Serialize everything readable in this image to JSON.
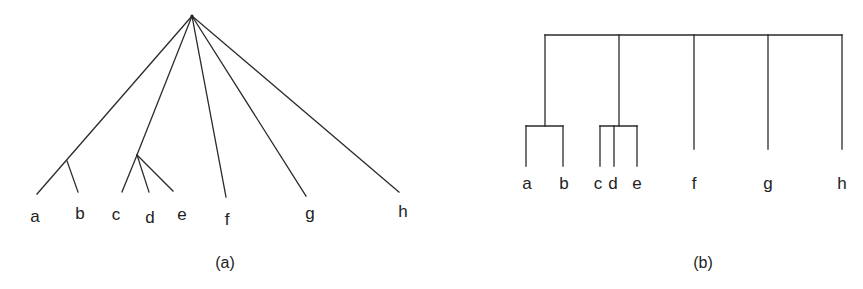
{
  "figure": {
    "panel_a": {
      "caption": "(a)",
      "type": "tree-diagram",
      "apex": [
        192,
        16
      ],
      "internal_nodes": {
        "ab": [
          67,
          161
        ],
        "cde": [
          137,
          155
        ]
      },
      "leaves": [
        {
          "label": "a",
          "end": [
            37,
            194
          ],
          "label_pos": [
            35,
            222
          ]
        },
        {
          "label": "b",
          "end": [
            78,
            192
          ],
          "label_pos": [
            80,
            219
          ]
        },
        {
          "label": "c",
          "end": [
            122,
            192
          ],
          "label_pos": [
            116,
            220
          ]
        },
        {
          "label": "d",
          "end": [
            149,
            192
          ],
          "label_pos": [
            150,
            223
          ]
        },
        {
          "label": "e",
          "end": [
            173,
            191
          ],
          "label_pos": [
            182,
            220
          ]
        },
        {
          "label": "f",
          "end": [
            226,
            197
          ],
          "label_pos": [
            227,
            225
          ]
        },
        {
          "label": "g",
          "end": [
            306,
            196
          ],
          "label_pos": [
            310,
            219
          ]
        },
        {
          "label": "h",
          "end": [
            399,
            192
          ],
          "label_pos": [
            403,
            217
          ]
        }
      ],
      "caption_pos": [
        225,
        268
      ]
    },
    "panel_b": {
      "caption": "(b)",
      "type": "dendrogram",
      "top_bar": {
        "y": 35,
        "x1": 545,
        "x2": 842
      },
      "labels": [
        "a",
        "b",
        "c",
        "d",
        "e",
        "f",
        "g",
        "h"
      ],
      "caption_pos": [
        703,
        268
      ]
    }
  }
}
